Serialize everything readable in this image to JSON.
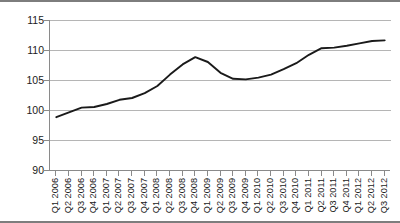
{
  "chart_data": {
    "type": "line",
    "title": "",
    "xlabel": "",
    "ylabel": "2006 = 100",
    "ylim": [
      90,
      115
    ],
    "yticks": [
      90,
      95,
      100,
      105,
      110,
      115
    ],
    "grid": true,
    "legend": false,
    "categories": [
      "Q1 2006",
      "Q2 2006",
      "Q3 2006",
      "Q4 2006",
      "Q1 2007",
      "Q2 2007",
      "Q3 2007",
      "Q4 2007",
      "Q1 2008",
      "Q2 2008",
      "Q3 2008",
      "Q4 2008",
      "Q1 2009",
      "Q2 2009",
      "Q3 2009",
      "Q4 2009",
      "Q1 2010",
      "Q2 2010",
      "Q3 2010",
      "Q4 2010",
      "Q1 2011",
      "Q2 2011",
      "Q3 2011",
      "Q4 2011",
      "Q1 2012",
      "Q2 2012",
      "Q3 2012"
    ],
    "values": [
      98.8,
      99.6,
      100.4,
      100.5,
      101.0,
      101.7,
      102.0,
      102.8,
      104.0,
      105.9,
      107.6,
      108.8,
      108.0,
      106.2,
      105.2,
      105.1,
      105.4,
      105.9,
      106.8,
      107.8,
      109.2,
      110.3,
      110.4,
      110.7,
      111.1,
      111.5,
      111.6
    ],
    "series_color": "#1a1a1a",
    "grid_color": "#b5b5b5",
    "axis_color": "#8a8a8a",
    "background": "#ffffff"
  }
}
